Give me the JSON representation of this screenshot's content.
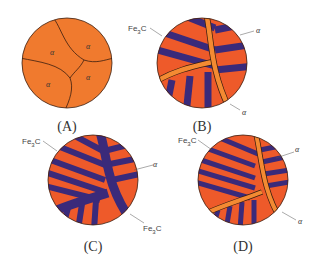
{
  "colors": {
    "ferrite": "#f07a2e",
    "pearlite_orange": "#ee5a2a",
    "cementite": "#3a2a7a",
    "outline": "#3a1e10",
    "text": "#333333"
  },
  "panels": [
    {
      "id": "A",
      "label": "(A)",
      "grain_labels": [
        "α",
        "α",
        "α",
        "α"
      ]
    },
    {
      "id": "B",
      "label": "(B)",
      "annotations": [
        "Fe3C",
        "α",
        "α"
      ]
    },
    {
      "id": "C",
      "label": "(C)",
      "annotations": [
        "Fe3C",
        "α",
        "Fe3C"
      ]
    },
    {
      "id": "D",
      "label": "(D)",
      "annotations": [
        "Fe3C",
        "α",
        "α"
      ]
    }
  ],
  "text": {
    "fe3c": "Fe",
    "fe3c_sub": "3",
    "fe3c_c": "C",
    "alpha": "α"
  }
}
